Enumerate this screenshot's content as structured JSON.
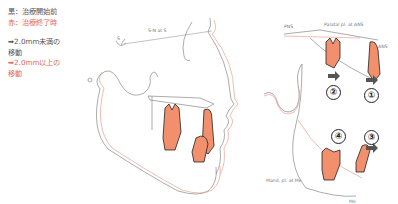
{
  "legend": {
    "black_line": "黒：治療開始前",
    "red_line": "赤：治療終了時",
    "small_move_1": "➡2.0mm未満の",
    "small_move_2": "移動",
    "large_move_1": "➡2.0mm以上の",
    "large_move_2": "移動"
  },
  "labels": {
    "s": "S",
    "sn": "S-N at S",
    "pns": "PNS",
    "palatal": "Palatal pl. at ANS",
    "ans": "ANS",
    "mand": "Mand. pl. at Me",
    "me": "Me"
  },
  "markers": {
    "m1": "①",
    "m2": "②",
    "m3": "③",
    "m4": "④"
  },
  "colors": {
    "before": "#222222",
    "after": "#e06a5a",
    "tooth_fill": "#f2906e"
  }
}
